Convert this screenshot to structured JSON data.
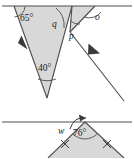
{
  "figure": {
    "colors": {
      "shade_fill": "#d8d8d8",
      "stroke": "#4d4d4d",
      "text": "#1a1a1a",
      "background": "#ffffff"
    },
    "top_diagram": {
      "name": "parallel-lines-triangle-diagram",
      "labels": {
        "angle_65": "65°",
        "angle_40": "40°",
        "angle_q": "q",
        "angle_p": "p",
        "angle_o": "o"
      },
      "marks": {
        "parallel_arrow_left": "parallel-arrow-marker",
        "parallel_arrow_right": "parallel-arrow-marker"
      }
    },
    "bottom_diagram": {
      "name": "isosceles-triangle-diagram",
      "labels": {
        "angle_76": "76°",
        "angle_w": "w"
      },
      "marks": {
        "tick_left": "congruent-side-tick",
        "tick_right": "congruent-side-tick"
      }
    }
  }
}
